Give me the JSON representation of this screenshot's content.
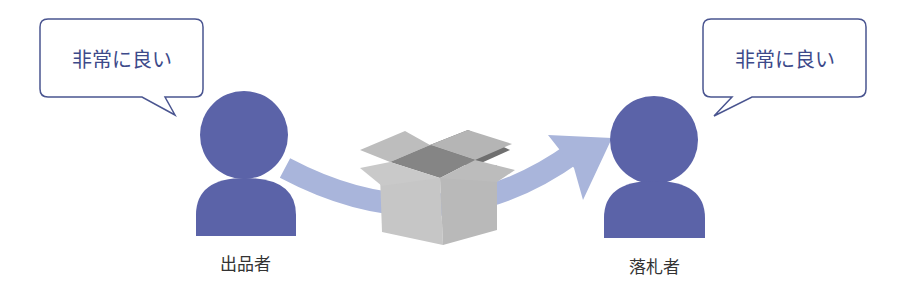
{
  "colors": {
    "person": "#5b63a8",
    "arrow": "#a9b5db",
    "bubble_border": "#4a5590",
    "bubble_text": "#3d4a8a",
    "box_light": "#c9c9c9",
    "box_mid": "#b0b0b0",
    "box_dark": "#7d7d7d"
  },
  "seller": {
    "label": "出品者",
    "speech": "非常に良い"
  },
  "buyer": {
    "label": "落札者",
    "speech": "非常に良い"
  },
  "package": {
    "icon": "open-box-icon"
  },
  "flow": {
    "icon": "curved-arrow-icon",
    "direction": "seller-to-buyer"
  }
}
